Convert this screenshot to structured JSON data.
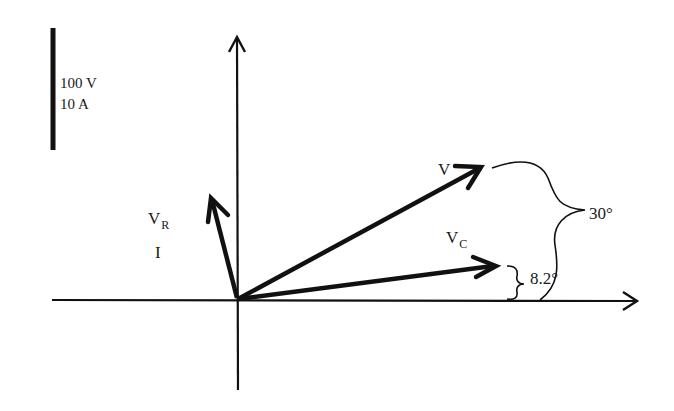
{
  "diagram": {
    "type": "phasor-diagram",
    "scale": {
      "voltage_label": "100 V",
      "current_label": "10 A"
    },
    "phasors": [
      {
        "id": "V",
        "label": "V",
        "subscript": "",
        "angle_deg": 30
      },
      {
        "id": "VC",
        "label": "V",
        "subscript": "C",
        "angle_deg": 8.2
      },
      {
        "id": "VR",
        "label": "V",
        "subscript": "R",
        "second_label": "I",
        "angle_deg": 98.2
      }
    ],
    "angles": {
      "v_angle_label": "30°",
      "vc_angle_label": "8.2°"
    },
    "colors": {
      "ink": "#111111",
      "background": "#ffffff"
    }
  }
}
